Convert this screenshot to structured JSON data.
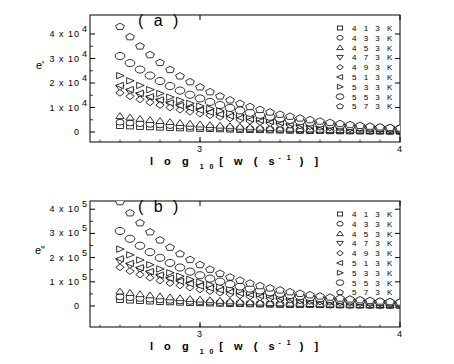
{
  "chart_data": [
    {
      "type": "scatter",
      "panel_label": "(a)",
      "title": "",
      "xlabel": "log 10 [w (s -1)]",
      "ylabel": "e'",
      "xlim": [
        2.45,
        4.0
      ],
      "ylim": [
        -5000,
        47000
      ],
      "x_ticks": [
        "3",
        "4"
      ],
      "y_ticks": [
        "0",
        "1 x 10 4",
        "2 x 10 4",
        "3 x 10 4",
        "4 x 10 4"
      ],
      "grid": false,
      "legend_position": "upper right",
      "x": [
        2.6,
        2.7,
        2.8,
        2.9,
        3.0,
        3.1,
        3.2,
        3.3,
        3.4,
        3.5,
        3.6,
        3.7,
        3.8,
        3.9,
        4.0
      ],
      "series": [
        {
          "name": "413 K",
          "marker": "square",
          "values": [
            2500,
            2100,
            1800,
            1500,
            1300,
            1100,
            900,
            750,
            600,
            500,
            400,
            300,
            250,
            200,
            150
          ]
        },
        {
          "name": "433 K",
          "marker": "circle",
          "values": [
            4000,
            3400,
            2900,
            2400,
            2000,
            1700,
            1400,
            1150,
            950,
            780,
            630,
            500,
            400,
            320,
            260
          ]
        },
        {
          "name": "453 K",
          "marker": "triangle-up",
          "values": [
            6500,
            5400,
            4500,
            3700,
            3100,
            2600,
            2150,
            1750,
            1450,
            1200,
            980,
            800,
            650,
            520,
            420
          ]
        },
        {
          "name": "473 K",
          "marker": "triangle-down",
          "values": [
            18000,
            15000,
            12500,
            10300,
            8500,
            7000,
            5700,
            4600,
            3700,
            3000,
            2400,
            1900,
            1500,
            1200,
            950
          ]
        },
        {
          "name": "493 K",
          "marker": "diamond",
          "values": [
            16000,
            13300,
            11000,
            9100,
            7500,
            6200,
            5000,
            4050,
            3250,
            2600,
            2100,
            1650,
            1300,
            1050,
            830
          ]
        },
        {
          "name": "513 K",
          "marker": "triangle-left",
          "values": [
            19000,
            15800,
            13100,
            10800,
            8900,
            7300,
            5900,
            4800,
            3850,
            3100,
            2500,
            2000,
            1600,
            1250,
            1000
          ]
        },
        {
          "name": "533 K",
          "marker": "triangle-right",
          "values": [
            23000,
            19000,
            15700,
            12900,
            10600,
            8600,
            7000,
            5650,
            4550,
            3650,
            2900,
            2300,
            1800,
            1420,
            1120
          ]
        },
        {
          "name": "553 K",
          "marker": "circle-large",
          "values": [
            31000,
            25500,
            20800,
            16900,
            13700,
            11000,
            8800,
            7000,
            5550,
            4400,
            3450,
            2700,
            2100,
            1650,
            1300
          ]
        },
        {
          "name": "573 K",
          "marker": "pentagon",
          "values": [
            43000,
            35000,
            28300,
            22800,
            18300,
            14600,
            11600,
            9100,
            7150,
            5600,
            4350,
            3350,
            2600,
            2000,
            1550
          ]
        }
      ]
    },
    {
      "type": "scatter",
      "panel_label": "(b)",
      "title": "",
      "xlabel": "log 10 [w (s -1)]",
      "ylabel": "e\"",
      "xlim": [
        2.45,
        4.0
      ],
      "ylim": [
        -50000,
        470000
      ],
      "x_ticks": [
        "3",
        "4"
      ],
      "y_ticks": [
        "0",
        "1 x 10 5",
        "2 x 10 5",
        "3 x 10 5",
        "4 x 10 5"
      ],
      "grid": false,
      "legend_position": "upper right",
      "x": [
        2.6,
        2.7,
        2.8,
        2.9,
        3.0,
        3.1,
        3.2,
        3.3,
        3.4,
        3.5,
        3.6,
        3.7,
        3.8,
        3.9,
        4.0
      ],
      "series": [
        {
          "name": "413 K",
          "marker": "square",
          "values": [
            25000,
            20500,
            17000,
            14000,
            11500,
            9500,
            7800,
            6400,
            5200,
            4300,
            3500,
            2800,
            2300,
            1900,
            1500
          ]
        },
        {
          "name": "433 K",
          "marker": "circle",
          "values": [
            38000,
            31000,
            25500,
            21000,
            17200,
            14100,
            11500,
            9400,
            7700,
            6300,
            5100,
            4100,
            3300,
            2700,
            2200
          ]
        },
        {
          "name": "453 K",
          "marker": "triangle-up",
          "values": [
            60000,
            49000,
            40000,
            32500,
            26500,
            21500,
            17500,
            14200,
            11500,
            9300,
            7500,
            6100,
            4900,
            4000,
            3200
          ]
        },
        {
          "name": "473 K",
          "marker": "triangle-down",
          "values": [
            185000,
            150000,
            121000,
            98000,
            79000,
            63500,
            51000,
            41000,
            33000,
            26500,
            21300,
            17100,
            13700,
            11000,
            8800
          ]
        },
        {
          "name": "493 K",
          "marker": "diamond",
          "values": [
            160000,
            130000,
            105000,
            85000,
            68500,
            55000,
            44300,
            35600,
            28600,
            23000,
            18500,
            14800,
            11900,
            9500,
            7600
          ]
        },
        {
          "name": "513 K",
          "marker": "triangle-left",
          "values": [
            195000,
            158000,
            128000,
            103000,
            83000,
            66800,
            53700,
            43100,
            34600,
            27800,
            22300,
            17900,
            14300,
            11500,
            9200
          ]
        },
        {
          "name": "533 K",
          "marker": "triangle-right",
          "values": [
            235000,
            190000,
            153000,
            123000,
            98500,
            79000,
            63300,
            50700,
            40600,
            32500,
            26000,
            20800,
            16600,
            13300,
            10600
          ]
        },
        {
          "name": "553 K",
          "marker": "circle-large",
          "values": [
            310000,
            249000,
            199000,
            159000,
            127000,
            101000,
            80500,
            64000,
            50900,
            40500,
            32200,
            25600,
            20300,
            16100,
            12800
          ]
        },
        {
          "name": "573 K",
          "marker": "pentagon",
          "values": [
            430000,
            343000,
            272000,
            215000,
            170000,
            134000,
            105500,
            83000,
            65300,
            51300,
            40300,
            31600,
            24800,
            19400,
            15200
          ]
        }
      ]
    }
  ],
  "panels": [
    {
      "label": "( a )",
      "ylabel": "e'",
      "yticks": [
        "0",
        "1 x 10",
        "2 x 10",
        "3 x 10",
        "4 x 10"
      ],
      "yexp": "4",
      "xticks": [
        "3",
        "4"
      ],
      "xlabel_main": "l o g",
      "xlabel_sub": "1 0",
      "xlabel_rest": "[ w  ( s",
      "xlabel_sup": "- 1",
      "xlabel_end": ") ]",
      "legend": [
        "4 1 3  K",
        "4 3 3  K",
        "4 5 3  K",
        "4 7 3  K",
        "4 9 3  K",
        "5 1 3  K",
        "5 3 3  K",
        "5 5 3  K",
        "5 7 3  K"
      ]
    },
    {
      "label": "( b )",
      "ylabel": "e\"",
      "yticks": [
        "0",
        "1 x 10",
        "2 x 10",
        "3 x 10",
        "4 x 10"
      ],
      "yexp": "5",
      "xticks": [
        "3",
        "4"
      ],
      "xlabel_main": "l o g",
      "xlabel_sub": "1 0",
      "xlabel_rest": "[ w  ( s",
      "xlabel_sup": "- 1",
      "xlabel_end": ") ]",
      "legend": [
        "4 1 3  K",
        "4 3 3  K",
        "4 5 3  K",
        "4 7 3  K",
        "4 9 3  K",
        "5 1 3  K",
        "5 3 3  K",
        "5 5 3  K",
        "5 7 3  K"
      ]
    }
  ]
}
